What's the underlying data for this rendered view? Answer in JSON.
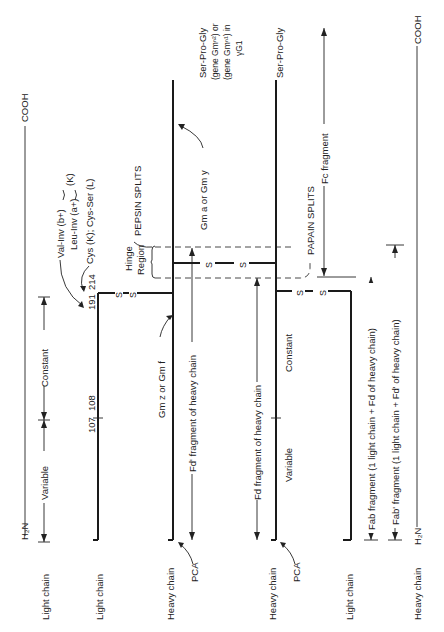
{
  "diagram": {
    "type": "immunoglobulin-structure",
    "orientation": "rotated-90-ccw",
    "chains": [
      {
        "id": "light-1",
        "label": "Light chain",
        "role": "light"
      },
      {
        "id": "heavy-1",
        "label": "Heavy chain",
        "role": "heavy",
        "n_terminal_label": "PCA"
      },
      {
        "id": "heavy-2",
        "label": "Heavy chain",
        "role": "heavy",
        "n_terminal_label": "PCA"
      },
      {
        "id": "light-2",
        "label": "Light chain",
        "role": "light"
      }
    ],
    "legend_light": {
      "label": "Light chain",
      "n_term": "H₂N",
      "c_term": "COOH",
      "variable": "Variable",
      "constant": "Constant"
    },
    "legend_heavy": {
      "label": "Heavy chain",
      "n_term": "H₂N",
      "c_term": "COOH"
    },
    "residues": {
      "r107": "107",
      "r108": "108",
      "r191": "191",
      "r214": "214"
    },
    "annotations": {
      "val_inv": "Val-Inv (b+)",
      "leu_inv": "Leu-Inv (a+)",
      "kappa": "(K)",
      "cys": "Cys (K); Cys-Ser (L)",
      "hinge_1": "Hinge",
      "hinge_2": "Region",
      "pepsin": "PEPSIN SPLITS",
      "papain": "PAPAIN SPLITS",
      "gm_a": "Gm a or Gm y",
      "gm_z": "Gm z or Gm f",
      "ser_pro_gly_1": "Ser-Pro-Gly",
      "ser_pro_gly_2": "Ser-Pro-Gly",
      "gene_1": "(gene Gmⁿ²) or",
      "gene_2": "(gene Gmⁿ¹) in",
      "gene_3": "γG1",
      "disulfide": "S",
      "variable": "Variable",
      "constant": "Constant"
    },
    "fragments": {
      "fd_prime": "Fd' fragment of heavy chain",
      "fd": "Fd fragment of heavy chain",
      "fc": "Fc fragment",
      "fab": "Fab fragment (1 light chain + Fd of heavy chain)",
      "fab_prime": "Fab' fragment (1 light chain + Fd' of heavy chain)"
    }
  }
}
